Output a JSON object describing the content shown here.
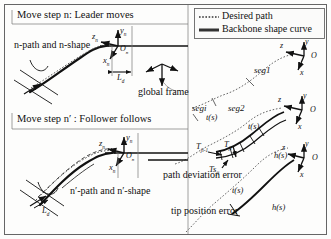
{
  "figure": {
    "type": "schematic-diagram",
    "title_absent": true,
    "border": "#555555",
    "ink": "#111111",
    "dashed_ink": "#666666"
  },
  "legend": {
    "box_label": "legend-box",
    "items": [
      {
        "key": "desired-path",
        "style": "dotted",
        "label": "Desired path"
      },
      {
        "key": "backbone-shape-curve",
        "style": "solid-thick",
        "label": "Backbone shape curve"
      }
    ]
  },
  "panels": {
    "leader": {
      "caption": "Move step n: Leader moves",
      "path_label": "n-path and n-shape",
      "frame": {
        "origin": "O",
        "origin_sub": "n",
        "x": "x",
        "x_sub": "n",
        "y": "y",
        "y_sub": "n",
        "z": "z",
        "z_sub": "n"
      },
      "dimension": {
        "symbol": "L",
        "sub": "d"
      }
    },
    "follower": {
      "caption": "Move step n′ : Follower follows",
      "path_label": "n′-path and n′-shape",
      "frame": {
        "origin": "O",
        "origin_sub": "n",
        "x": "x",
        "x_sub": "n",
        "y": "y",
        "y_sub": "n",
        "z": "z",
        "z_sub": "n"
      },
      "dimension": {
        "symbol": "L",
        "sub": "d"
      }
    },
    "global_frame": {
      "label": "global frame"
    }
  },
  "right_diagram": {
    "segments": [
      "seg1",
      "seg2",
      "segi"
    ],
    "curve_functions": {
      "tangent": "t(s)",
      "normal": "h(s)"
    },
    "transforms": [
      {
        "symbol": "T",
        "sub": "ji-1"
      },
      {
        "symbol": "T",
        "sub": "ji"
      },
      {
        "symbol": "Ts",
        "sub": "ji"
      }
    ],
    "annotations": [
      {
        "key": "path-deviation-error",
        "label": "path deviation error"
      },
      {
        "key": "tip-position-error",
        "label": "tip position error"
      }
    ],
    "frames": [
      {
        "key": "frame-top",
        "origin": "O",
        "x": "x",
        "y": "y",
        "z": "z"
      },
      {
        "key": "frame-middle",
        "origin": "O",
        "x": "x",
        "y": "y",
        "z": "z"
      },
      {
        "key": "frame-bottom",
        "origin": "O",
        "x": "x",
        "y": "y",
        "z": "z"
      }
    ],
    "function_labels": [
      "t(s)",
      "t(s)",
      "t(s)",
      "h(s)",
      "h(s)"
    ]
  }
}
